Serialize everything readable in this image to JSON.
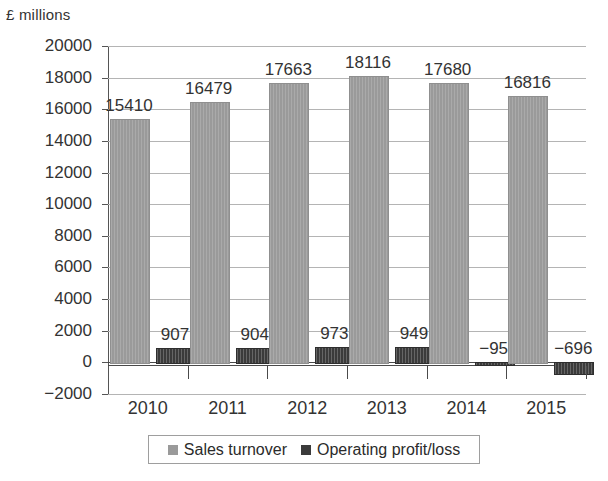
{
  "chart_data": {
    "type": "bar",
    "title": "",
    "subtitle": "",
    "xlabel": "",
    "ylabel": "£ millions",
    "ylim": [
      -2000,
      20000
    ],
    "ytick_step": 2000,
    "yticks": [
      20000,
      18000,
      16000,
      14000,
      12000,
      10000,
      8000,
      6000,
      4000,
      2000,
      0,
      -2000
    ],
    "ytick_labels": [
      "20000",
      "18000",
      "16000",
      "14000",
      "12000",
      "10000",
      "8000",
      "6000",
      "4000",
      "2000",
      "0",
      "−2000"
    ],
    "grid": true,
    "legend_position": "bottom",
    "categories": [
      "2010",
      "2011",
      "2012",
      "2013",
      "2014",
      "2015"
    ],
    "series": [
      {
        "name": "Sales turnover",
        "color": "#9a9a9a",
        "values": [
          15410,
          16479,
          17663,
          18116,
          17680,
          16816
        ],
        "labels": [
          "15410",
          "16479",
          "17663",
          "18116",
          "17680",
          "16816"
        ]
      },
      {
        "name": "Operating profit/loss",
        "color": "#3b3b3b",
        "values": [
          907,
          904,
          973,
          949,
          -95,
          -696
        ],
        "labels": [
          "907",
          "904",
          "973",
          "949",
          "−95",
          "−696"
        ]
      }
    ]
  },
  "legend": {
    "items": [
      {
        "label": "Sales turnover",
        "swatch": "sales"
      },
      {
        "label": "Operating profit/loss",
        "swatch": "profit"
      }
    ]
  }
}
